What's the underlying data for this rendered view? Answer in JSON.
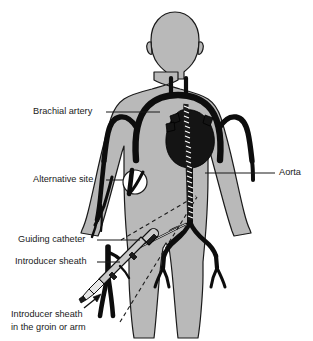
{
  "colors": {
    "background": "#ffffff",
    "body_fill": "#b9b9b9",
    "body_outline": "#1a1a1a",
    "vessel": "#0d0d0d",
    "heart": "#141414",
    "catheter_shaft": "#c9c9c9",
    "catheter_tip": "#e8e8e8",
    "label_text": "#1a1a1a",
    "site_marker": "#ffffff"
  },
  "labels": [
    {
      "id": "brachial-artery",
      "text": "Brachial artery",
      "x": 33,
      "y": 112,
      "anchor": "start",
      "leader": "straight"
    },
    {
      "id": "alternative-site",
      "text": "Alternative site",
      "x": 33,
      "y": 180,
      "anchor": "start",
      "leader": "straight"
    },
    {
      "id": "aorta",
      "text": "Aorta",
      "x": 279,
      "y": 173,
      "anchor": "start",
      "leader": "straight"
    },
    {
      "id": "guiding-catheter",
      "text": "Guiding catheter",
      "x": 18,
      "y": 240,
      "anchor": "start",
      "leader": "straight"
    },
    {
      "id": "introducer-sheath",
      "text": "Introducer sheath",
      "x": 15,
      "y": 262,
      "anchor": "start",
      "leader": "straight"
    }
  ],
  "label_multiline": {
    "id": "introducer-sheath-groin",
    "line1": "Introducer sheath",
    "line2": "in the groin or arm",
    "x": 11,
    "y1": 317,
    "y2": 330
  },
  "anatomy": {
    "structures": [
      "head",
      "neck",
      "torso",
      "left arm",
      "right arm",
      "legs",
      "aortic arch",
      "subclavian arteries",
      "brachial arteries",
      "descending aorta",
      "iliac arteries",
      "femoral arteries",
      "heart"
    ]
  },
  "devices": {
    "items": [
      "guiding catheter",
      "introducer sheath",
      "catheter coil in aorta",
      "insertion arrow"
    ]
  }
}
